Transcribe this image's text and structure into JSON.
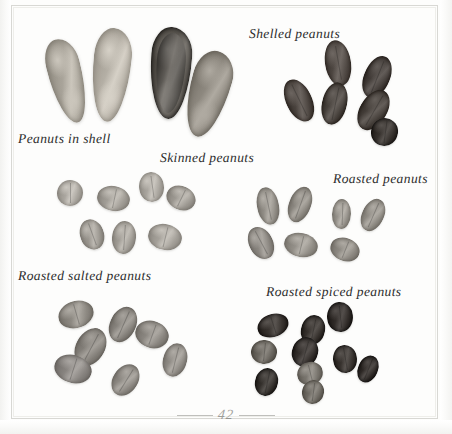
{
  "page": {
    "folio": "42",
    "background_color": "#fdfdfc",
    "frame_color": "#d8d8d4",
    "ink_color": "#2b2b2b"
  },
  "plate": {
    "title_present": false,
    "medium": "black-and-white photographic plate",
    "groups": [
      {
        "id": "peanuts-in-shell",
        "label": "Peanuts in shell",
        "label_x": 18,
        "label_y": 131,
        "count": 4,
        "tone": "light tan shells, one dark opened shell",
        "color_light": "#b9b4aa",
        "color_dark": "#55514c",
        "specimens": [
          {
            "x": 50,
            "y": 38,
            "w": 34,
            "h": 86,
            "rot": -14,
            "shade": "#a9a49a",
            "type": "shell"
          },
          {
            "x": 92,
            "y": 28,
            "w": 38,
            "h": 94,
            "rot": 6,
            "shade": "#b4afa5",
            "type": "shell"
          },
          {
            "x": 150,
            "y": 27,
            "w": 41,
            "h": 92,
            "rot": 4,
            "shade": "#5a5650",
            "type": "shell-open"
          },
          {
            "x": 188,
            "y": 50,
            "w": 40,
            "h": 88,
            "rot": 16,
            "shade": "#8d887f",
            "type": "shell"
          }
        ]
      },
      {
        "id": "shelled-peanuts",
        "label": "Shelled peanuts",
        "label_x": 249,
        "label_y": 26,
        "count": 6,
        "tone": "dark red-brown skins",
        "color_light": "#6e6660",
        "color_dark": "#3a3531",
        "specimens": [
          {
            "x": 325,
            "y": 40,
            "w": 26,
            "h": 46,
            "rot": -10,
            "shade": "#4d4641"
          },
          {
            "x": 364,
            "y": 55,
            "w": 26,
            "h": 44,
            "rot": 22,
            "shade": "#413b37"
          },
          {
            "x": 286,
            "y": 78,
            "w": 26,
            "h": 45,
            "rot": -26,
            "shade": "#4a433e"
          },
          {
            "x": 322,
            "y": 82,
            "w": 25,
            "h": 43,
            "rot": 12,
            "shade": "#46403b"
          },
          {
            "x": 360,
            "y": 88,
            "w": 27,
            "h": 44,
            "rot": 30,
            "shade": "#433d38"
          },
          {
            "x": 371,
            "y": 118,
            "w": 27,
            "h": 28,
            "rot": 8,
            "shade": "#35302c"
          }
        ]
      },
      {
        "id": "skinned-peanuts",
        "label": "Skinned peanuts",
        "label_x": 160,
        "label_y": 150,
        "count": 7,
        "tone": "pale grey-beige blanched kernels",
        "color_light": "#bdb9b2",
        "color_dark": "#8f8b84",
        "specimens": [
          {
            "x": 57,
            "y": 180,
            "w": 26,
            "h": 26,
            "rot": 0,
            "shade": "#aaa69f"
          },
          {
            "x": 97,
            "y": 186,
            "w": 33,
            "h": 25,
            "rot": 12,
            "shade": "#a29e97"
          },
          {
            "x": 139,
            "y": 172,
            "w": 25,
            "h": 30,
            "rot": -8,
            "shade": "#a8a49d"
          },
          {
            "x": 166,
            "y": 186,
            "w": 30,
            "h": 24,
            "rot": 26,
            "shade": "#9d9992"
          },
          {
            "x": 80,
            "y": 219,
            "w": 24,
            "h": 31,
            "rot": -20,
            "shade": "#9b9790"
          },
          {
            "x": 112,
            "y": 221,
            "w": 24,
            "h": 33,
            "rot": 4,
            "shade": "#a09c95"
          },
          {
            "x": 148,
            "y": 224,
            "w": 34,
            "h": 26,
            "rot": 14,
            "shade": "#a5a19a"
          }
        ]
      },
      {
        "id": "roasted-peanuts",
        "label": "Roasted peanuts",
        "label_x": 333,
        "label_y": 171,
        "count": 7,
        "tone": "mid-grey roasted kernels",
        "color_light": "#a3a099",
        "color_dark": "#7b7770",
        "specimens": [
          {
            "x": 257,
            "y": 187,
            "w": 22,
            "h": 38,
            "rot": -12,
            "shade": "#918d86"
          },
          {
            "x": 289,
            "y": 186,
            "w": 22,
            "h": 37,
            "rot": 20,
            "shade": "#8b8780"
          },
          {
            "x": 332,
            "y": 199,
            "w": 19,
            "h": 30,
            "rot": 2,
            "shade": "#96928b"
          },
          {
            "x": 362,
            "y": 198,
            "w": 22,
            "h": 34,
            "rot": 24,
            "shade": "#8e8a83"
          },
          {
            "x": 249,
            "y": 226,
            "w": 24,
            "h": 34,
            "rot": -28,
            "shade": "#8a8680"
          },
          {
            "x": 284,
            "y": 233,
            "w": 34,
            "h": 24,
            "rot": 14,
            "shade": "#949089"
          },
          {
            "x": 330,
            "y": 238,
            "w": 30,
            "h": 23,
            "rot": 22,
            "shade": "#8d8982"
          }
        ]
      },
      {
        "id": "roasted-salted-peanuts",
        "label": "Roasted salted peanuts",
        "label_x": 18,
        "label_y": 268,
        "count": 7,
        "tone": "grey salted kernels",
        "color_light": "#9b9790",
        "color_dark": "#6f6b65",
        "specimens": [
          {
            "x": 58,
            "y": 301,
            "w": 36,
            "h": 27,
            "rot": -16,
            "shade": "#8d8982"
          },
          {
            "x": 110,
            "y": 306,
            "w": 26,
            "h": 37,
            "rot": 24,
            "shade": "#85817b"
          },
          {
            "x": 135,
            "y": 321,
            "w": 34,
            "h": 27,
            "rot": 20,
            "shade": "#8a8680"
          },
          {
            "x": 76,
            "y": 327,
            "w": 29,
            "h": 40,
            "rot": 28,
            "shade": "#827e78"
          },
          {
            "x": 163,
            "y": 343,
            "w": 24,
            "h": 34,
            "rot": 14,
            "shade": "#8e8a84"
          },
          {
            "x": 54,
            "y": 355,
            "w": 38,
            "h": 28,
            "rot": 18,
            "shade": "#888480"
          },
          {
            "x": 113,
            "y": 363,
            "w": 25,
            "h": 34,
            "rot": 32,
            "shade": "#8b8781"
          }
        ]
      },
      {
        "id": "roasted-spiced-peanuts",
        "label": "Roasted spiced peanuts",
        "label_x": 266,
        "label_y": 284,
        "count": 10,
        "tone": "very dark spiced coating",
        "color_light": "#7d7972",
        "color_dark": "#2e2a27",
        "specimens": [
          {
            "x": 257,
            "y": 314,
            "w": 32,
            "h": 23,
            "rot": -18,
            "shade": "#38332f"
          },
          {
            "x": 301,
            "y": 315,
            "w": 24,
            "h": 30,
            "rot": 12,
            "shade": "#35302c"
          },
          {
            "x": 327,
            "y": 302,
            "w": 26,
            "h": 30,
            "rot": -6,
            "shade": "#312c29"
          },
          {
            "x": 251,
            "y": 340,
            "w": 26,
            "h": 24,
            "rot": 6,
            "shade": "#6a665f"
          },
          {
            "x": 292,
            "y": 337,
            "w": 26,
            "h": 30,
            "rot": 16,
            "shade": "#332e2b"
          },
          {
            "x": 333,
            "y": 345,
            "w": 24,
            "h": 28,
            "rot": -10,
            "shade": "#37322e"
          },
          {
            "x": 358,
            "y": 355,
            "w": 20,
            "h": 28,
            "rot": 22,
            "shade": "#2f2a27"
          },
          {
            "x": 255,
            "y": 368,
            "w": 23,
            "h": 28,
            "rot": 12,
            "shade": "#34302c"
          },
          {
            "x": 297,
            "y": 362,
            "w": 26,
            "h": 23,
            "rot": -14,
            "shade": "#7a766f"
          },
          {
            "x": 302,
            "y": 380,
            "w": 22,
            "h": 24,
            "rot": 8,
            "shade": "#6d6962"
          }
        ]
      }
    ]
  }
}
